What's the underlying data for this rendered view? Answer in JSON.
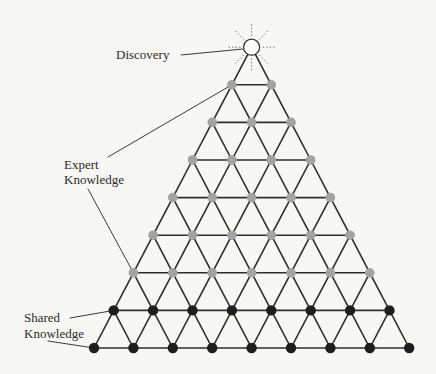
{
  "labels": {
    "discovery": "Discovery",
    "expert_line1": "Expert",
    "expert_line2": "Knowledge",
    "shared_line1": "Shared",
    "shared_line2": "Knowledge"
  },
  "colors": {
    "line": "#2e2e2e",
    "expert_node": "#a3a3a3",
    "shared_node": "#1e1e1e",
    "discovery_node": "#ffffff",
    "background": "#f7f7f6"
  },
  "grid": {
    "rows_bottom_to_top": [
      9,
      8,
      7,
      6,
      5,
      4,
      3,
      2
    ],
    "shared_rows": 2,
    "expert_rows": 6,
    "apex": "discovery"
  }
}
